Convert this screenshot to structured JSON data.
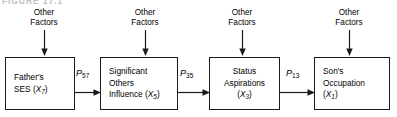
{
  "figure": {
    "caption": "FIGURE 17.1",
    "type": "path-diagram"
  },
  "exogenous": {
    "label_line1": "Other",
    "label_line2": "Factors",
    "items": [
      {
        "line1": "Other",
        "line2": "Factors",
        "target": "fathers-ses"
      },
      {
        "line1": "Other",
        "line2": "Factors",
        "target": "significant-others-influence"
      },
      {
        "line1": "Other",
        "line2": "Factors",
        "target": "status-aspirations"
      },
      {
        "line1": "Other",
        "line2": "Factors",
        "target": "sons-occupation"
      }
    ]
  },
  "nodes": [
    {
      "id": "fathers-ses",
      "name": "Father's SES",
      "line1": "Father's",
      "line2": "SES",
      "variable": "X",
      "subscript": "7",
      "lines": 2
    },
    {
      "id": "significant-others-influence",
      "name": "Significant Others Influence",
      "line1": "Significant",
      "line2": "Others",
      "line3": "Influence",
      "variable": "X",
      "subscript": "5",
      "lines": 3
    },
    {
      "id": "status-aspirations",
      "name": "Status Aspirations",
      "line1": "Status",
      "line2": "Aspirations",
      "variable": "X",
      "subscript": "3",
      "lines": 3
    },
    {
      "id": "sons-occupation",
      "name": "Son's Occupation",
      "line1": "Son's",
      "line2": "Occupation",
      "variable": "X",
      "subscript": "1",
      "lines": 3
    }
  ],
  "paths": [
    {
      "id": "p57",
      "symbol": "P",
      "subscript": "57",
      "from": "fathers-ses",
      "to": "significant-others-influence"
    },
    {
      "id": "p35",
      "symbol": "P",
      "subscript": "35",
      "from": "significant-others-influence",
      "to": "status-aspirations"
    },
    {
      "id": "p13",
      "symbol": "P",
      "subscript": "13",
      "from": "status-aspirations",
      "to": "sons-occupation"
    }
  ],
  "colors": {
    "stroke": "#1a1a1a",
    "text": "#000000",
    "background": "#ffffff"
  }
}
